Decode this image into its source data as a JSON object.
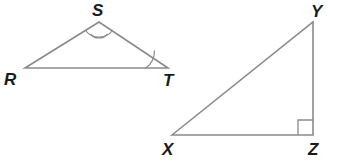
{
  "figure": {
    "background_color": "#ffffff",
    "stroke_color": "#8a8a8a",
    "label_color": "#1a1a1a",
    "stroke_width": 1.6
  },
  "triangles": [
    {
      "id": "RST",
      "name": "triangle-rst",
      "vertices": [
        {
          "label": "R",
          "name": "vertex-r",
          "x": 25,
          "y": 68,
          "label_x": 4,
          "label_y": 85
        },
        {
          "label": "S",
          "name": "vertex-s",
          "x": 99,
          "y": 22,
          "label_x": 92,
          "label_y": 16
        },
        {
          "label": "T",
          "name": "vertex-t",
          "x": 168,
          "y": 68,
          "label_x": 163,
          "label_y": 86
        }
      ],
      "path": "M 25 68 L 99 22 L 168 68 Z",
      "angle_marks": [
        {
          "name": "angle-mark-s-double",
          "at": "S",
          "type": "double-arc",
          "arcs": [
            "M 85.5 30.5 A 17 17 0 0 0 112.5 30.5",
            "M 90.5 34 A 11 11 0 0 0 107.5 34"
          ]
        },
        {
          "name": "angle-mark-t-single",
          "at": "T",
          "type": "single-arc",
          "arcs": [
            "M 146 68 A 22 22 0 0 0 154.5 50.5"
          ]
        }
      ]
    },
    {
      "id": "XYZ",
      "name": "triangle-xyz",
      "vertices": [
        {
          "label": "X",
          "name": "vertex-x",
          "x": 172,
          "y": 135,
          "label_x": 162,
          "label_y": 155
        },
        {
          "label": "Y",
          "name": "vertex-y",
          "x": 313,
          "y": 22,
          "label_x": 311,
          "label_y": 17
        },
        {
          "label": "Z",
          "name": "vertex-z",
          "x": 313,
          "y": 135,
          "label_x": 308,
          "label_y": 155
        }
      ],
      "path": "M 172 135 L 313 22 L 313 135 Z",
      "angle_marks": [
        {
          "name": "right-angle-mark-z",
          "at": "Z",
          "type": "right-angle-square",
          "square": "M 298 135 L 298 120 L 313 120"
        }
      ]
    }
  ]
}
